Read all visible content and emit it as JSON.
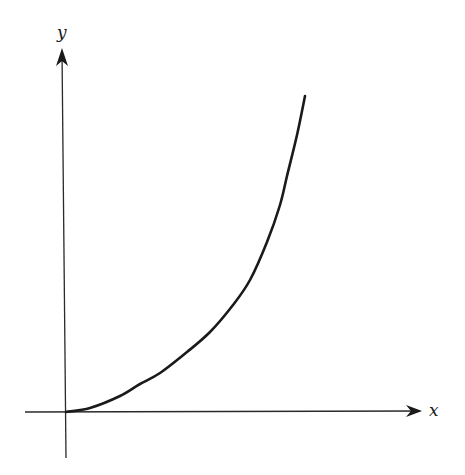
{
  "chart_data": {
    "type": "line",
    "title": "",
    "xlabel": "x",
    "ylabel": "y",
    "grid": false,
    "legend": null,
    "ticks": {
      "x": [],
      "y": []
    },
    "series": [
      {
        "name": "curve",
        "color": "#1a1a1a",
        "points_px": [
          [
            66,
            412
          ],
          [
            90,
            408
          ],
          [
            120,
            396
          ],
          [
            140,
            384
          ],
          [
            160,
            373
          ],
          [
            187,
            352
          ],
          [
            210,
            332
          ],
          [
            233,
            305
          ],
          [
            250,
            280
          ],
          [
            267,
            242
          ],
          [
            280,
            205
          ],
          [
            287,
            176
          ],
          [
            297,
            135
          ],
          [
            305,
            96
          ]
        ]
      }
    ]
  },
  "axes": {
    "x_label": "x",
    "y_label": "y",
    "color": "#2a2a2a",
    "origin_px": [
      66,
      412
    ]
  },
  "colors": {
    "background": "#ffffff",
    "ink": "#1a1a1a"
  }
}
